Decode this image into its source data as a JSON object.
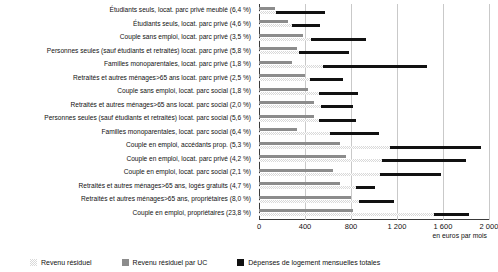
{
  "chart_data": {
    "type": "bar",
    "orientation": "horizontal",
    "title": "",
    "xlabel": "en euros par mois",
    "ylabel": "",
    "xlim": [
      0,
      2000
    ],
    "xticks": [
      0,
      400,
      800,
      1200,
      1600,
      2000
    ],
    "xtick_labels": [
      "0",
      "400",
      "800",
      "1 200",
      "1 600",
      "2 000"
    ],
    "grid": true,
    "legend_position": "bottom",
    "categories": [
      "Étudiants seuls, locat. parc privé meublé (6,4 %)",
      "Étudiants seuls, locat. parc privé (4,6 %)",
      "Couple sans emploi, locat. parc privé (3,5 %)",
      "Personnes seules (sauf étudiants et retraités) locat. parc privé (5,8 %)",
      "Familles monoparentales, locat. parc privé (1,8 %)",
      "Retraités et autres ménages>65 ans locat. parc privé (2,5 %)",
      "Couple sans emploi, locat. parc social (1,8 %)",
      "Retraités et autres ménages>65 ans locat. parc social (2,0 %)",
      "Personnes seules (sauf étudiants et retraités) locat. parc social (5,6 %)",
      "Familles monoparentales, locat. parc social (6,4 %)",
      "Couple en emploi, accédants prop. (5,3 %)",
      "Couple en emploi, locat. parc privé (4,2 %)",
      "Couple en emploi, locat. parc social (2,1 %)",
      "Retraités et autres ménages>65 ans, logés gratuits (4,7 %)",
      "Retraités et autres ménages>65 ans, propriétaires (8,0 %)",
      "Couple en emploi, propriétaires (23,8 %)"
    ],
    "series": [
      {
        "name": "Revenu résiduel par UC",
        "color": "#8c8c8c",
        "values": [
          140,
          250,
          380,
          330,
          290,
          400,
          430,
          480,
          480,
          330,
          700,
          760,
          640,
          700,
          800,
          820
        ]
      },
      {
        "name": "Revenu résiduel",
        "color": "#d9d9d9",
        "values": [
          150,
          290,
          450,
          350,
          560,
          440,
          520,
          540,
          520,
          620,
          1140,
          1070,
          1050,
          840,
          870,
          1520
        ]
      },
      {
        "name": "Dépenses de logement mensuelles totales",
        "color": "#111111",
        "values": [
          420,
          240,
          480,
          430,
          900,
          290,
          340,
          280,
          320,
          420,
          790,
          730,
          530,
          170,
          300,
          310
        ]
      }
    ],
    "legend": [
      {
        "label": "Revenu résiduel",
        "swatch": "res"
      },
      {
        "label": "Revenu résiduel par UC",
        "swatch": "uc"
      },
      {
        "label": "Dépenses de logement mensuelles totales",
        "swatch": "dep"
      }
    ]
  }
}
